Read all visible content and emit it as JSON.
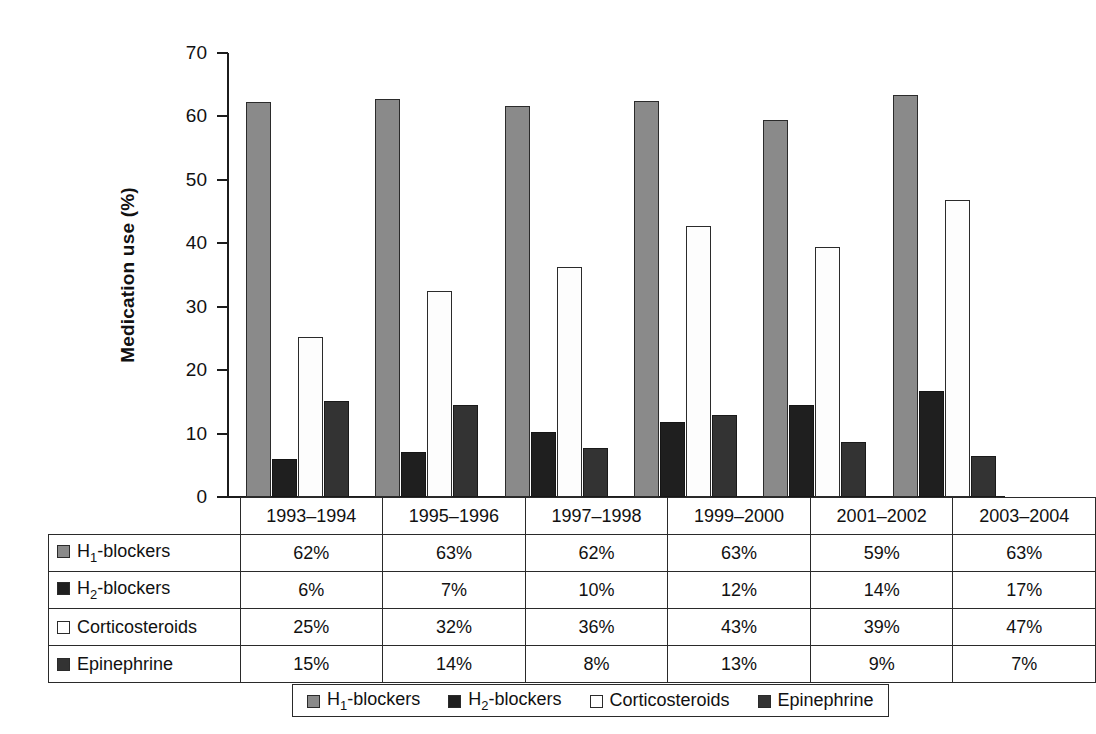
{
  "chart_data": {
    "type": "bar",
    "title": "",
    "xlabel": "",
    "ylabel": "Medication use (%)",
    "ylim": [
      0,
      70
    ],
    "yticks": [
      "0",
      "10",
      "20",
      "30",
      "40",
      "50",
      "60",
      "70"
    ],
    "grid": false,
    "legend_position": "bottom",
    "categories": [
      "1993–1994",
      "1995–1996",
      "1997–1998",
      "1999–2000",
      "2001–2002",
      "2003–2004"
    ],
    "series": [
      {
        "name": "H1-blockers",
        "key": "h1",
        "color": "#8a8a8a",
        "values": [
          62,
          63,
          62,
          63,
          59,
          63
        ],
        "bar_heights": [
          62.3,
          62.8,
          61.7,
          62.5,
          59.4,
          63.4
        ]
      },
      {
        "name": "H2-blockers",
        "key": "h2",
        "color": "#1f1f1f",
        "values": [
          6,
          7,
          10,
          12,
          14,
          17
        ],
        "bar_heights": [
          6.0,
          7.1,
          10.2,
          11.9,
          14.5,
          16.7
        ]
      },
      {
        "name": "Corticosteroids",
        "key": "cs",
        "color": "#ffffff",
        "values": [
          25,
          32,
          36,
          43,
          39,
          47
        ],
        "bar_heights": [
          25.3,
          32.5,
          36.2,
          42.7,
          39.4,
          46.9
        ]
      },
      {
        "name": "Epinephrine",
        "key": "ep",
        "color": "#333333",
        "values": [
          15,
          14,
          8,
          13,
          9,
          7
        ],
        "bar_heights": [
          15.2,
          14.5,
          7.7,
          12.9,
          8.6,
          6.5
        ]
      }
    ]
  },
  "axis": {
    "y_title": "Medication use (%)",
    "y_ticks": [
      {
        "label": "70",
        "value": 70
      },
      {
        "label": "60",
        "value": 60
      },
      {
        "label": "50",
        "value": 50
      },
      {
        "label": "40",
        "value": 40
      },
      {
        "label": "30",
        "value": 30
      },
      {
        "label": "20",
        "value": 20
      },
      {
        "label": "10",
        "value": 10
      },
      {
        "label": "0",
        "value": 0
      }
    ]
  },
  "table": {
    "column_headers": [
      "",
      "1993–1994",
      "1995–1996",
      "1997–1998",
      "1999–2000",
      "2001–2002",
      "2003–2004"
    ],
    "rows": [
      {
        "label_prefix": "H",
        "label_sub": "1",
        "label_suffix": "-blockers",
        "swatch": "s0",
        "cells": [
          "62%",
          "63%",
          "62%",
          "63%",
          "59%",
          "63%"
        ]
      },
      {
        "label_prefix": "H",
        "label_sub": "2",
        "label_suffix": "-blockers",
        "swatch": "s1",
        "cells": [
          "6%",
          "7%",
          "10%",
          "12%",
          "14%",
          "17%"
        ]
      },
      {
        "label_prefix": "Corticosteroids",
        "label_sub": "",
        "label_suffix": "",
        "swatch": "s2",
        "cells": [
          "25%",
          "32%",
          "36%",
          "43%",
          "39%",
          "47%"
        ]
      },
      {
        "label_prefix": "Epinephrine",
        "label_sub": "",
        "label_suffix": "",
        "swatch": "s3",
        "cells": [
          "15%",
          "14%",
          "8%",
          "13%",
          "9%",
          "7%"
        ]
      }
    ]
  },
  "legend": {
    "items": [
      {
        "label_prefix": "H",
        "label_sub": "1",
        "label_suffix": "-blockers",
        "swatch": "s0"
      },
      {
        "label_prefix": "H",
        "label_sub": "2",
        "label_suffix": "-blockers",
        "swatch": "s1"
      },
      {
        "label_prefix": "Corticosteroids",
        "label_sub": "",
        "label_suffix": "",
        "swatch": "s2"
      },
      {
        "label_prefix": "Epinephrine",
        "label_sub": "",
        "label_suffix": "",
        "swatch": "s3"
      }
    ]
  },
  "colors": {
    "h1": "#8a8a8a",
    "h2": "#1f1f1f",
    "corticosteroids": "#ffffff",
    "epinephrine": "#333333",
    "axis": "#1c1c1c"
  }
}
